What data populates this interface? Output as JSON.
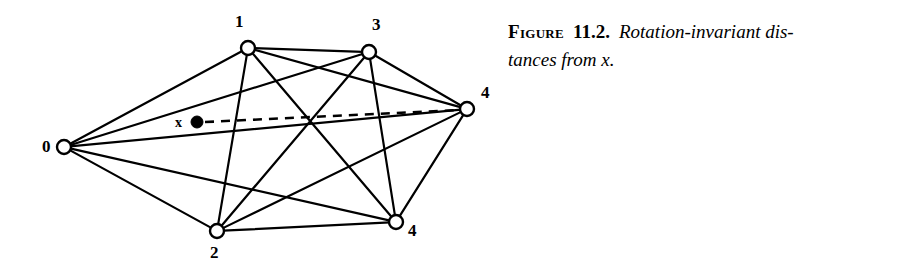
{
  "figure": {
    "caption": {
      "figure_word": "Figure",
      "number": "11.2.",
      "line1_text": "Rotation-invariant dis-",
      "line2_text": "tances from x."
    },
    "graph": {
      "type": "complete-graph",
      "node_count": 6,
      "edge_count": 15,
      "stroke_color": "#000000",
      "node_fill": "#ffffff",
      "background": "#ffffff",
      "nodes": [
        {
          "id": "n0",
          "label": "0",
          "cx": 64,
          "cy": 147,
          "r": 7,
          "label_x": 42,
          "label_y": 138
        },
        {
          "id": "n1",
          "label": "1",
          "cx": 248,
          "cy": 48,
          "r": 7,
          "label_x": 235,
          "label_y": 13
        },
        {
          "id": "n3",
          "label": "3",
          "cx": 369,
          "cy": 52,
          "r": 7,
          "label_x": 372,
          "label_y": 16
        },
        {
          "id": "n4r",
          "label": "4",
          "cx": 467,
          "cy": 109,
          "r": 7,
          "label_x": 481,
          "label_y": 84
        },
        {
          "id": "n4b",
          "label": "4",
          "cx": 396,
          "cy": 222,
          "r": 7,
          "label_x": 408,
          "label_y": 222
        },
        {
          "id": "n2",
          "label": "2",
          "cx": 217,
          "cy": 231,
          "r": 7,
          "label_x": 210,
          "label_y": 244
        }
      ],
      "edges": [
        {
          "from": "n0",
          "to": "n1"
        },
        {
          "from": "n0",
          "to": "n3"
        },
        {
          "from": "n0",
          "to": "n4r"
        },
        {
          "from": "n0",
          "to": "n4b"
        },
        {
          "from": "n0",
          "to": "n2"
        },
        {
          "from": "n1",
          "to": "n3"
        },
        {
          "from": "n1",
          "to": "n4r"
        },
        {
          "from": "n1",
          "to": "n4b"
        },
        {
          "from": "n1",
          "to": "n2"
        },
        {
          "from": "n3",
          "to": "n4r"
        },
        {
          "from": "n3",
          "to": "n4b"
        },
        {
          "from": "n3",
          "to": "n2"
        },
        {
          "from": "n4r",
          "to": "n4b"
        },
        {
          "from": "n4r",
          "to": "n2"
        },
        {
          "from": "n4b",
          "to": "n2"
        }
      ],
      "query_point": {
        "label": "x",
        "cx": 197,
        "cy": 122,
        "r": 6,
        "label_x": 175,
        "label_y": 116,
        "fill": "#000000"
      },
      "dashed_line": {
        "from_x": 205,
        "from_y": 122,
        "to_x": 460,
        "to_y": 110,
        "dash": "9 7",
        "width": 2.6
      }
    }
  }
}
